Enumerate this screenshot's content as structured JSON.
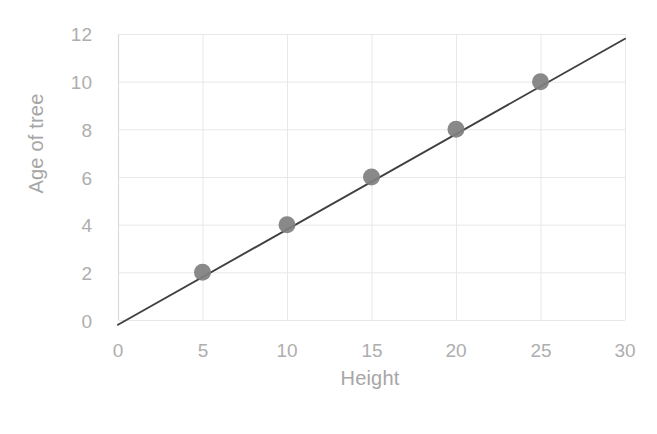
{
  "chart_data": {
    "type": "scatter",
    "title": "",
    "xlabel": "Height",
    "ylabel": "Age of tree",
    "xlim": [
      0,
      30
    ],
    "ylim": [
      0,
      12
    ],
    "x_ticks": [
      "0",
      "5",
      "10",
      "15",
      "20",
      "25",
      "30"
    ],
    "y_ticks": [
      "0",
      "2",
      "4",
      "6",
      "8",
      "10",
      "12"
    ],
    "grid": true,
    "legend": "none",
    "x": [
      5,
      10,
      15,
      20,
      25
    ],
    "y": [
      2,
      4,
      6,
      8,
      10
    ],
    "points": [
      {
        "x": 5,
        "y": 2
      },
      {
        "x": 10,
        "y": 4
      },
      {
        "x": 15,
        "y": 6
      },
      {
        "x": 20,
        "y": 8
      },
      {
        "x": 25,
        "y": 10
      }
    ],
    "series": [
      {
        "name": "Age of tree",
        "marker": "circle",
        "marker_color": "#7f7f7f",
        "values": [
          2,
          4,
          6,
          8,
          10
        ]
      }
    ],
    "trendline": {
      "type": "linear",
      "slope": 0.4,
      "intercept": -0.2,
      "color": "#404040",
      "x_start": 0,
      "y_start": -0.2,
      "x_end": 30,
      "y_end": 11.8
    },
    "colors": {
      "marker": "#7f7f7f",
      "line": "#404040",
      "grid": "#e8e8e8",
      "axis_text": "#aeaeae",
      "title_text": "#a6a6a6",
      "background": "#ffffff"
    }
  },
  "axis": {
    "y_title": "Age of tree",
    "x_title": "Height"
  }
}
